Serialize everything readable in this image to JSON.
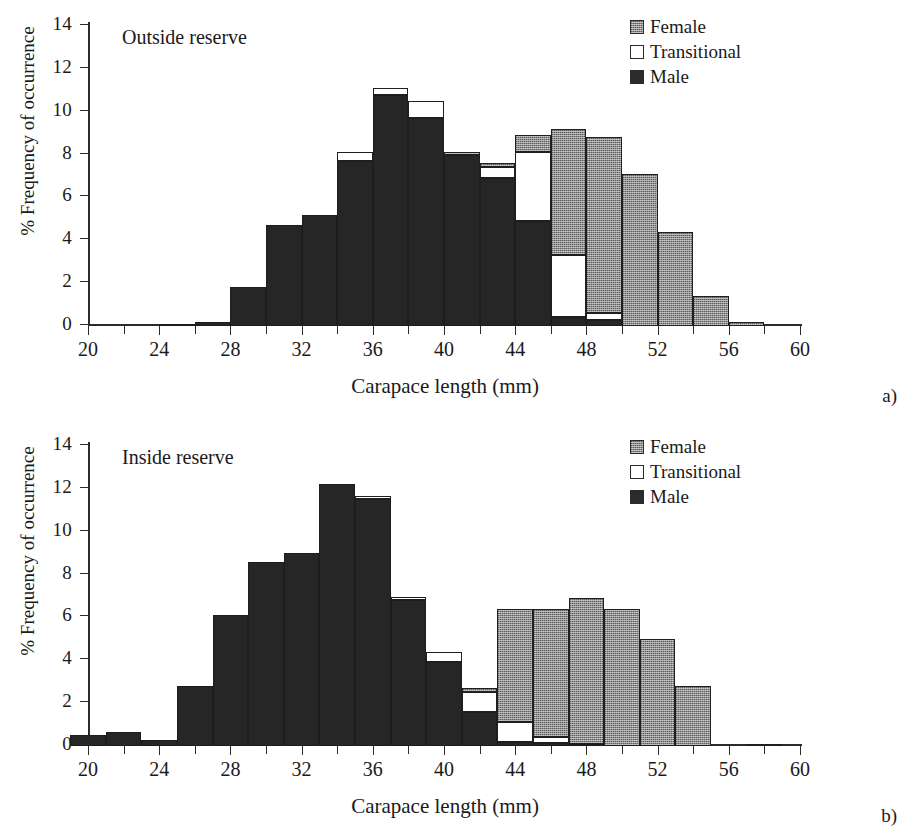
{
  "figure": {
    "xlabel": "Carapace length (mm)",
    "ylabel": "% Frequency of occurrence",
    "legend": [
      {
        "key": "female",
        "label": "Female",
        "swatch": "stippled-grey"
      },
      {
        "key": "transitional",
        "label": "Transitional",
        "swatch": "white-open"
      },
      {
        "key": "male",
        "label": "Male",
        "swatch": "solid-black"
      }
    ]
  },
  "panel_a": {
    "tag": "a)",
    "note": "Outside reserve"
  },
  "panel_b": {
    "tag": "b)",
    "note": "Inside reserve"
  },
  "chart_data": [
    {
      "type": "bar",
      "subtype": "stacked-histogram",
      "panel": "a",
      "title": "Outside reserve",
      "xlabel": "Carapace length (mm)",
      "ylabel": "% Frequency of occurrence",
      "xlim": [
        20,
        60
      ],
      "ylim": [
        0,
        14
      ],
      "ytick_values": [
        0,
        2,
        4,
        6,
        8,
        10,
        12,
        14
      ],
      "xtick_values": [
        20,
        24,
        28,
        32,
        36,
        40,
        44,
        48,
        52,
        56,
        60
      ],
      "xtick_minor_step": 2,
      "bin_width": 2,
      "grid": false,
      "legend_position": "top-right",
      "bin_starts": [
        20,
        22,
        24,
        26,
        28,
        30,
        32,
        34,
        36,
        38,
        40,
        42,
        44,
        46,
        48,
        50,
        52,
        54,
        56,
        58
      ],
      "bin_labels": [
        "20-22",
        "22-24",
        "24-26",
        "26-28",
        "28-30",
        "30-32",
        "32-34",
        "34-36",
        "36-38",
        "38-40",
        "40-42",
        "42-44",
        "44-46",
        "46-48",
        "48-50",
        "50-52",
        "52-54",
        "54-56",
        "56-58",
        "58-60"
      ],
      "series": [
        {
          "name": "Male",
          "values": [
            0,
            0,
            0.1,
            0.2,
            1.8,
            4.7,
            5.2,
            7.7,
            10.8,
            9.7,
            8.0,
            6.9,
            4.9,
            0.4,
            0.3,
            0,
            0,
            0,
            0,
            0
          ]
        },
        {
          "name": "Transitional",
          "values": [
            0,
            0,
            0,
            0,
            0,
            0,
            0,
            0.4,
            0.3,
            0.8,
            0.0,
            0.5,
            3.2,
            2.9,
            0.3,
            0,
            0,
            0,
            0,
            0
          ]
        },
        {
          "name": "Female",
          "values": [
            0,
            0,
            0,
            0,
            0,
            0,
            0,
            0,
            0,
            0,
            0.1,
            0.2,
            0.8,
            5.9,
            8.2,
            7.1,
            4.4,
            1.4,
            0.2,
            0
          ]
        }
      ],
      "totals": [
        0,
        0,
        0.1,
        0.2,
        1.8,
        4.7,
        5.2,
        8.1,
        11.1,
        10.5,
        8.1,
        7.6,
        8.9,
        9.2,
        8.8,
        7.1,
        4.4,
        1.4,
        0.2,
        0
      ]
    },
    {
      "type": "bar",
      "subtype": "stacked-histogram",
      "panel": "b",
      "title": "Inside reserve",
      "xlabel": "Carapace length (mm)",
      "ylabel": "% Frequency of occurrence",
      "xlim": [
        20,
        60
      ],
      "ylim": [
        0,
        14
      ],
      "ytick_values": [
        0,
        2,
        4,
        6,
        8,
        10,
        12,
        14
      ],
      "xtick_values": [
        20,
        24,
        28,
        32,
        36,
        40,
        44,
        48,
        52,
        56,
        60
      ],
      "xtick_minor_step": 2,
      "bin_width": 2,
      "grid": false,
      "legend_position": "top-right",
      "bin_starts": [
        19,
        21,
        23,
        25,
        27,
        29,
        31,
        33,
        35,
        37,
        39,
        41,
        43,
        45,
        47,
        49,
        51,
        53,
        55,
        57
      ],
      "bin_labels": [
        "19-21",
        "21-23",
        "23-25",
        "25-27",
        "27-29",
        "29-31",
        "31-33",
        "33-35",
        "35-37",
        "37-39",
        "39-41",
        "41-43",
        "43-45",
        "45-47",
        "47-49",
        "49-51",
        "51-53",
        "53-55",
        "55-57",
        "57-59"
      ],
      "series": [
        {
          "name": "Male",
          "values": [
            0.5,
            0.65,
            0.3,
            2.8,
            6.1,
            8.6,
            9.0,
            12.25,
            11.55,
            6.8,
            3.9,
            1.6,
            0.2,
            0.15,
            0.1,
            0,
            0,
            0,
            0,
            0
          ]
        },
        {
          "name": "Transitional",
          "values": [
            0,
            0,
            0,
            0,
            0,
            0,
            0,
            0,
            0.1,
            0.15,
            0.5,
            0.9,
            0.9,
            0.25,
            0,
            0,
            0,
            0,
            0,
            0
          ]
        },
        {
          "name": "Female",
          "values": [
            0,
            0,
            0,
            0,
            0,
            0,
            0,
            0,
            0,
            0,
            0,
            0.2,
            5.3,
            6.0,
            6.8,
            6.4,
            5.0,
            2.8,
            0,
            0.1
          ]
        }
      ],
      "totals": [
        0.5,
        0.65,
        0.3,
        2.8,
        6.1,
        8.6,
        9.0,
        12.25,
        11.65,
        6.95,
        4.4,
        2.7,
        6.4,
        6.4,
        6.9,
        6.4,
        5.0,
        2.8,
        0,
        0.1
      ]
    }
  ]
}
